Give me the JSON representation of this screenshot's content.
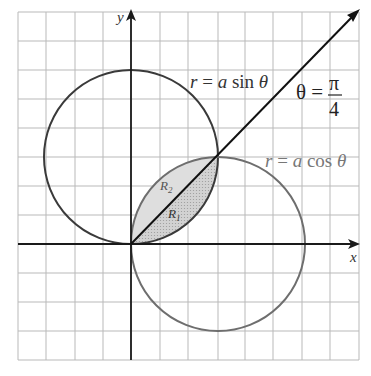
{
  "figure": {
    "type": "polar-region-diagram",
    "grid": {
      "x_lines": [
        18,
        46,
        75,
        103,
        131,
        160,
        188,
        218,
        245,
        273,
        302,
        330,
        359
      ],
      "y_lines": [
        12,
        41,
        70,
        99,
        128,
        157,
        186,
        215,
        244,
        273,
        302,
        331,
        360
      ],
      "color": "#b9b9b9"
    },
    "axes": {
      "origin_px": [
        131,
        244
      ],
      "x_label": "x",
      "y_label": "y",
      "color": "#1a1a1a"
    },
    "curves": [
      {
        "name": "sine-circle",
        "label": "r = a sin θ",
        "label_parts": [
          "r",
          " = ",
          "a",
          " sin ",
          "θ"
        ],
        "center_px": [
          131,
          157
        ],
        "radius_px": 87,
        "color": "#3a3a3a"
      },
      {
        "name": "cosine-circle",
        "label": "r = a cos θ",
        "label_parts": [
          "r",
          " = ",
          "a",
          " cos ",
          "θ"
        ],
        "center_px": [
          218,
          244
        ],
        "radius_px": 87,
        "color": "#6e6e6e"
      }
    ],
    "ray": {
      "label_lhs": "θ =",
      "label_num": "π",
      "label_den": "4",
      "end_px": [
        359,
        10
      ],
      "color": "#111111"
    },
    "regions": [
      {
        "name": "R2",
        "label": "R",
        "subscript": "2",
        "fill": "#dcdcdc"
      },
      {
        "name": "R1",
        "label": "R",
        "subscript": "1",
        "fill": "#c8c8c8"
      }
    ]
  }
}
